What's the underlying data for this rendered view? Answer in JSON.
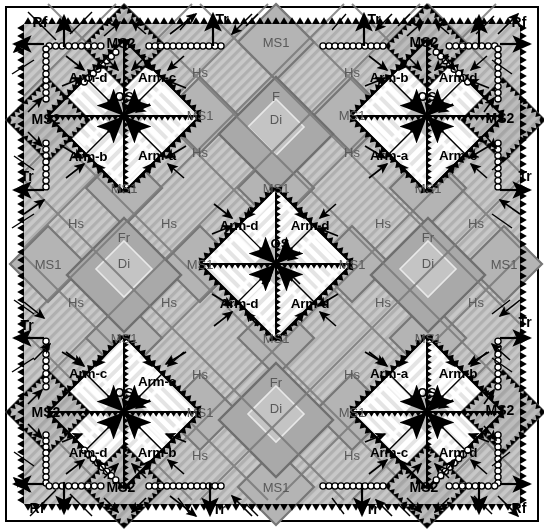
{
  "figure": {
    "type": "structural-geology-block-diagram",
    "title": "",
    "border_color": "#000000",
    "background": "#ffffff"
  },
  "palette": {
    "ms1_fill": "#b3b3b3",
    "hs_fill": "#c6c6c6",
    "hs_hatch": "#9a9a9a",
    "fr_fill": "#a8a8a8",
    "di_fill": "#c0c0c0",
    "arm_fill": "#ffffff",
    "arm_hatch": "#e2e2e2",
    "ms2_fill": "#b8b8b8",
    "os_fill": "#bdbdbd",
    "outline": "#6e6e6e",
    "ink": "#000000",
    "grey_text": "#595959"
  },
  "legend_terms": {
    "ms1": "MS1",
    "ms2": "MS2",
    "hs": "Hs",
    "fr": "Fr",
    "f": "F",
    "di": "Di",
    "os": "OS",
    "tr": "Tr",
    "rf": "Rf",
    "arm_a": "Arm-a",
    "arm_b": "Arm-b",
    "arm_c": "Arm-c",
    "arm_d": "Arm-d"
  },
  "edge_labels": [
    {
      "id": "rf-top-left",
      "text": "Rf",
      "x": 40,
      "y": 22
    },
    {
      "id": "tr-top-left",
      "text": "Tr",
      "x": 222,
      "y": 19
    },
    {
      "id": "tr-top-right",
      "text": "Tr",
      "x": 374,
      "y": 19
    },
    {
      "id": "rf-top-right",
      "text": "Rf",
      "x": 519,
      "y": 22
    },
    {
      "id": "tr-left-upper",
      "text": "Tr",
      "x": 27,
      "y": 176
    },
    {
      "id": "tr-right-upper",
      "text": "Tr",
      "x": 525,
      "y": 176
    },
    {
      "id": "tr-left-lower",
      "text": "Tr",
      "x": 27,
      "y": 325
    },
    {
      "id": "tr-right-lower",
      "text": "Tr",
      "x": 525,
      "y": 322
    },
    {
      "id": "rf-bottom-left",
      "text": "Rf",
      "x": 37,
      "y": 508
    },
    {
      "id": "tr-bottom-left",
      "text": "Tr",
      "x": 219,
      "y": 509
    },
    {
      "id": "tr-bottom-right",
      "text": "Tr",
      "x": 372,
      "y": 509
    },
    {
      "id": "rf-bottom-right",
      "text": "Rf",
      "x": 519,
      "y": 508
    }
  ],
  "ms2_labels": [
    {
      "id": "ms2-top-left",
      "text": "MS2",
      "x": 121,
      "y": 43
    },
    {
      "id": "ms2-top-right",
      "text": "MS2",
      "x": 424,
      "y": 42
    },
    {
      "id": "ms2-left-upper",
      "text": "MS2",
      "x": 46,
      "y": 119
    },
    {
      "id": "ms2-right-upper",
      "text": "MS2",
      "x": 500,
      "y": 118
    },
    {
      "id": "ms2-left-lower",
      "text": "MS2",
      "x": 46,
      "y": 412
    },
    {
      "id": "ms2-right-lower",
      "text": "MS2",
      "x": 500,
      "y": 410
    },
    {
      "id": "ms2-bottom-left",
      "text": "MS2",
      "x": 121,
      "y": 487
    },
    {
      "id": "ms2-bottom-right",
      "text": "MS2",
      "x": 424,
      "y": 487
    }
  ],
  "arm_labels": [
    {
      "id": "arm-tl-d",
      "text": "Arm-d",
      "x": 88,
      "y": 77
    },
    {
      "id": "arm-tl-c",
      "text": "Arm-c",
      "x": 157,
      "y": 77
    },
    {
      "id": "arm-tl-b",
      "text": "Arm-b",
      "x": 88,
      "y": 156
    },
    {
      "id": "arm-tl-a",
      "text": "Arm-a",
      "x": 157,
      "y": 155
    },
    {
      "id": "arm-tr-b",
      "text": "Arm-b",
      "x": 389,
      "y": 77
    },
    {
      "id": "arm-tr-d",
      "text": "Arm-d",
      "x": 458,
      "y": 77
    },
    {
      "id": "arm-tr-a",
      "text": "Arm-a",
      "x": 389,
      "y": 155
    },
    {
      "id": "arm-tr-c",
      "text": "Arm-c",
      "x": 458,
      "y": 155
    },
    {
      "id": "arm-ctr-dl",
      "text": "Arm-d",
      "x": 239,
      "y": 225
    },
    {
      "id": "arm-ctr-dr",
      "text": "Arm-d",
      "x": 310,
      "y": 225
    },
    {
      "id": "arm-ctr-dbl",
      "text": "Arm-d",
      "x": 239,
      "y": 303
    },
    {
      "id": "arm-ctr-dbr",
      "text": "Arm-d",
      "x": 310,
      "y": 303
    },
    {
      "id": "arm-bl-c",
      "text": "Arm-c",
      "x": 88,
      "y": 373
    },
    {
      "id": "arm-bl-a",
      "text": "Arm-a",
      "x": 157,
      "y": 381
    },
    {
      "id": "arm-bl-d",
      "text": "Arm-d",
      "x": 88,
      "y": 452
    },
    {
      "id": "arm-bl-b",
      "text": "Arm-b",
      "x": 157,
      "y": 452
    },
    {
      "id": "arm-br-a",
      "text": "Arm-a",
      "x": 389,
      "y": 373
    },
    {
      "id": "arm-br-b",
      "text": "Arm-b",
      "x": 458,
      "y": 373
    },
    {
      "id": "arm-br-c",
      "text": "Arm-c",
      "x": 389,
      "y": 452
    },
    {
      "id": "arm-br-d",
      "text": "Arm-d",
      "x": 458,
      "y": 452
    }
  ],
  "os_labels": [
    {
      "id": "os-top-left",
      "text": "OS",
      "x": 124,
      "y": 96
    },
    {
      "id": "os-top-right",
      "text": "OS",
      "x": 427,
      "y": 96
    },
    {
      "id": "os-center",
      "text": "OS",
      "x": 280,
      "y": 243
    },
    {
      "id": "os-bottom-left",
      "text": "OS",
      "x": 124,
      "y": 392
    },
    {
      "id": "os-bottom-right",
      "text": "OS",
      "x": 427,
      "y": 392
    }
  ],
  "ms1_labels": [
    {
      "id": "ms1-t1",
      "text": "MS1",
      "x": 276,
      "y": 42
    },
    {
      "id": "ms1-u-l",
      "text": "MS1",
      "x": 200,
      "y": 115
    },
    {
      "id": "ms1-u-r",
      "text": "MS1",
      "x": 352,
      "y": 115
    },
    {
      "id": "ms1-c-tl",
      "text": "MS1",
      "x": 124,
      "y": 188
    },
    {
      "id": "ms1-c-tm",
      "text": "MS1",
      "x": 276,
      "y": 188
    },
    {
      "id": "ms1-c-tr",
      "text": "MS1",
      "x": 428,
      "y": 188
    },
    {
      "id": "ms1-m-l",
      "text": "MS1",
      "x": 48,
      "y": 264
    },
    {
      "id": "ms1-m-ml",
      "text": "MS1",
      "x": 200,
      "y": 264
    },
    {
      "id": "ms1-m-mr",
      "text": "MS1",
      "x": 352,
      "y": 264
    },
    {
      "id": "ms1-m-r",
      "text": "MS1",
      "x": 504,
      "y": 264
    },
    {
      "id": "ms1-c-bl",
      "text": "MS1",
      "x": 124,
      "y": 338
    },
    {
      "id": "ms1-c-bm",
      "text": "MS1",
      "x": 276,
      "y": 338
    },
    {
      "id": "ms1-c-br",
      "text": "MS1",
      "x": 428,
      "y": 338
    },
    {
      "id": "ms1-l-l",
      "text": "MS1",
      "x": 200,
      "y": 412
    },
    {
      "id": "ms1-l-r",
      "text": "MS1",
      "x": 352,
      "y": 412
    },
    {
      "id": "ms1-b1",
      "text": "MS1",
      "x": 276,
      "y": 487
    }
  ],
  "hs_labels": [
    {
      "id": "hs-1",
      "text": "Hs",
      "x": 200,
      "y": 72
    },
    {
      "id": "hs-2",
      "text": "Hs",
      "x": 352,
      "y": 72
    },
    {
      "id": "hs-3",
      "text": "Hs",
      "x": 200,
      "y": 152
    },
    {
      "id": "hs-4",
      "text": "Hs",
      "x": 352,
      "y": 152
    },
    {
      "id": "hs-5",
      "text": "Hs",
      "x": 76,
      "y": 223
    },
    {
      "id": "hs-6",
      "text": "Hs",
      "x": 169,
      "y": 223
    },
    {
      "id": "hs-7",
      "text": "Hs",
      "x": 383,
      "y": 223
    },
    {
      "id": "hs-8",
      "text": "Hs",
      "x": 476,
      "y": 223
    },
    {
      "id": "hs-9",
      "text": "Hs",
      "x": 76,
      "y": 302
    },
    {
      "id": "hs-10",
      "text": "Hs",
      "x": 169,
      "y": 302
    },
    {
      "id": "hs-11",
      "text": "Hs",
      "x": 383,
      "y": 302
    },
    {
      "id": "hs-12",
      "text": "Hs",
      "x": 476,
      "y": 302
    },
    {
      "id": "hs-13",
      "text": "Hs",
      "x": 200,
      "y": 374
    },
    {
      "id": "hs-14",
      "text": "Hs",
      "x": 352,
      "y": 374
    },
    {
      "id": "hs-15",
      "text": "Hs",
      "x": 200,
      "y": 455
    },
    {
      "id": "hs-16",
      "text": "Hs",
      "x": 352,
      "y": 455
    }
  ],
  "fr_labels": [
    {
      "id": "f-top",
      "text": "F",
      "x": 276,
      "y": 96
    },
    {
      "id": "fr-left",
      "text": "Fr",
      "x": 124,
      "y": 237
    },
    {
      "id": "fr-right",
      "text": "Fr",
      "x": 428,
      "y": 237
    },
    {
      "id": "fr-bottom",
      "text": "Fr",
      "x": 276,
      "y": 382
    }
  ],
  "di_labels": [
    {
      "id": "di-top",
      "text": "Di",
      "x": 276,
      "y": 119
    },
    {
      "id": "di-left",
      "text": "Di",
      "x": 124,
      "y": 263
    },
    {
      "id": "di-right",
      "text": "Di",
      "x": 428,
      "y": 263
    },
    {
      "id": "di-bottom",
      "text": "Di",
      "x": 276,
      "y": 408
    }
  ]
}
